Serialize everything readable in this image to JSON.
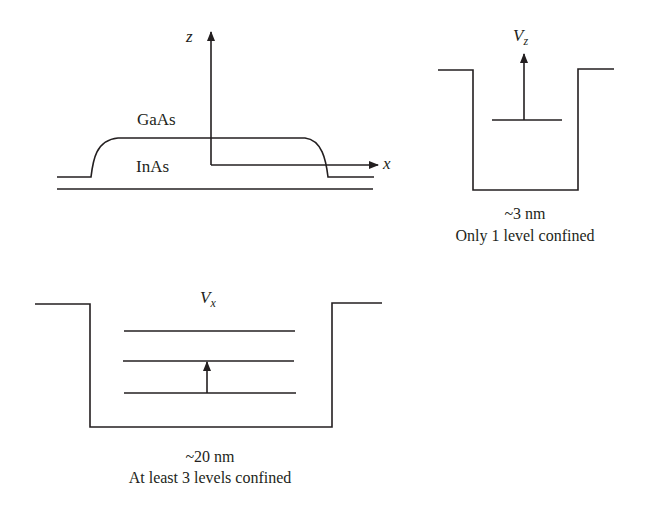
{
  "figure": {
    "panel_geometry": {
      "axes": {
        "z_axis_label": "z",
        "x_axis_label": "x"
      },
      "layers": {
        "top_material": "GaAs",
        "dot_material": "InAs"
      }
    },
    "panel_vz": {
      "potential_label_base": "V",
      "potential_label_sub": "z",
      "width_label": "~3 nm",
      "caption": "Only 1 level confined",
      "confined_levels": 1
    },
    "panel_vx": {
      "potential_label_base": "V",
      "potential_label_sub": "x",
      "width_label": "~20 nm",
      "caption": "At least 3 levels confined",
      "confined_levels": 3
    },
    "colors": {
      "line": "#231f20",
      "background": "#ffffff"
    }
  }
}
